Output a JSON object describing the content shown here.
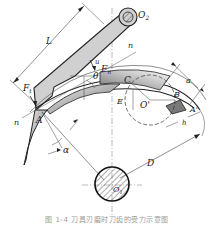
{
  "figure": {
    "type": "mechanical-diagram",
    "labels": {
      "O2": "O",
      "O2_sub": "2",
      "O1": "O",
      "O1_sub": "1",
      "L": "L",
      "n_top": "n",
      "n_left": "n",
      "Ft": "F",
      "Ft_sub": "t",
      "Fn": "F",
      "Fn_sub": "n",
      "u": "u",
      "theta": "θ",
      "A": "A",
      "A_prime": "A'",
      "B": "B",
      "C": "C",
      "E": "E",
      "O": "O'",
      "a": "a",
      "h": "h",
      "D": "D",
      "alpha": "α"
    },
    "colors": {
      "line": "#222222",
      "thin_line": "#555555",
      "fill_grey": "#d4d4d4",
      "fill_dark": "#8a8a8a",
      "background": "#ffffff"
    }
  },
  "caption": "图 1-4  刀具刃磨时刀齿的受力示意图"
}
